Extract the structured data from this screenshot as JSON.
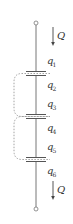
{
  "diagram": {
    "colors": {
      "wire": "#777777",
      "plate": "#555555",
      "dotted": "#999999",
      "text": "#333333"
    },
    "top_arrow": {
      "label": "Q"
    },
    "bottom_arrow": {
      "label": "Q"
    },
    "charges": [
      {
        "base": "q",
        "sub": "1"
      },
      {
        "base": "q",
        "sub": "2"
      },
      {
        "base": "q",
        "sub": "3"
      },
      {
        "base": "q",
        "sub": "4"
      },
      {
        "base": "q",
        "sub": "5"
      },
      {
        "base": "q",
        "sub": "6"
      }
    ]
  }
}
